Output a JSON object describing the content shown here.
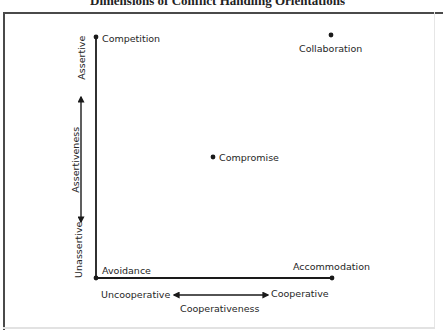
{
  "title": "Dimensions of Conflict Handling Orientations",
  "axes": {
    "x": {
      "name": "Cooperativeness",
      "low_label": "Uncooperative",
      "high_label": "Cooperative"
    },
    "y": {
      "name": "Assertiveness",
      "low_label": "Unassertive",
      "high_label": "Assertive"
    }
  },
  "points": [
    {
      "id": "competition",
      "label": "Competition",
      "assertiveness": "high",
      "cooperativeness": "low"
    },
    {
      "id": "collaboration",
      "label": "Collaboration",
      "assertiveness": "high",
      "cooperativeness": "high"
    },
    {
      "id": "compromise",
      "label": "Compromise",
      "assertiveness": "medium",
      "cooperativeness": "medium"
    },
    {
      "id": "avoidance",
      "label": "Avoidance",
      "assertiveness": "low",
      "cooperativeness": "low"
    },
    {
      "id": "accommodation",
      "label": "Accommodation",
      "assertiveness": "low",
      "cooperativeness": "high"
    }
  ],
  "colors": {
    "ink": "#1a1a1a",
    "frame": "#4a4a4a",
    "background": "#ffffff"
  }
}
